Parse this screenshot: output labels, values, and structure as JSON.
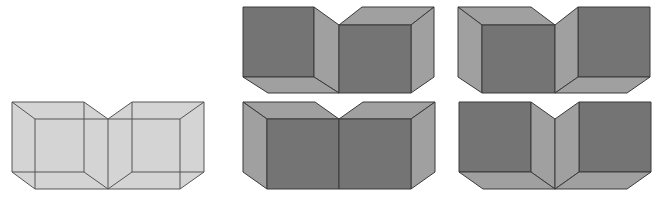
{
  "figure": {
    "colors": {
      "background": "#ffffff",
      "wireframe_fill": "#d4d4d4",
      "wireframe_stroke": "#555555",
      "dark_face": "#747474",
      "light_face": "#a0a0a0",
      "edge": "#3a3a3a"
    },
    "panels": [
      {
        "id": "wireframe",
        "label": "transparent wireframe",
        "position": "bottom-left"
      },
      {
        "id": "interp-1",
        "label": "interpretation 1",
        "position": "top-middle"
      },
      {
        "id": "interp-2",
        "label": "interpretation 2",
        "position": "top-right"
      },
      {
        "id": "interp-3",
        "label": "interpretation 3",
        "position": "bottom-middle"
      },
      {
        "id": "interp-4",
        "label": "interpretation 4",
        "position": "bottom-right"
      }
    ]
  }
}
